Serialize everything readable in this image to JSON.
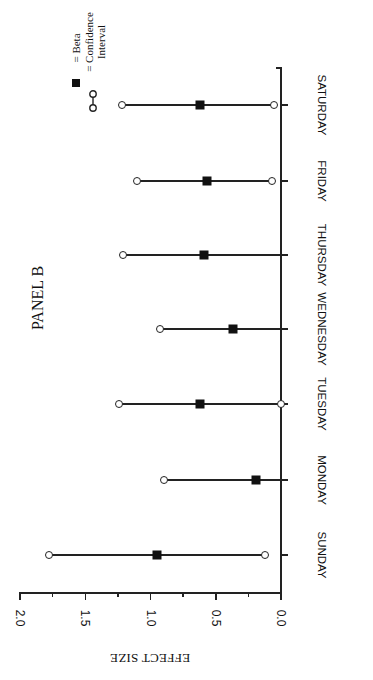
{
  "panel_label": "PANEL B",
  "legend": {
    "beta_label": "= Beta",
    "ci_label_line1": "= Confidence",
    "ci_label_line2": "Interval"
  },
  "axis": {
    "xlabel": "EFFECT SIZE",
    "ticks": [
      "2.0",
      "1.5",
      "1.0",
      "0.5",
      "0.0"
    ]
  },
  "chart_data": {
    "type": "scatter",
    "title": "PANEL B",
    "orientation": "rotated 90 degrees (categories along vertical axis, effect size along horizontal axis increasing to the left)",
    "xlabel": "EFFECT SIZE",
    "ylabel": "",
    "xlim": [
      0.0,
      2.0
    ],
    "xticks": [
      0.0,
      0.5,
      1.0,
      1.5,
      2.0
    ],
    "grid": false,
    "legend": [
      "Beta (filled square)",
      "Confidence Interval (open circles joined by line)"
    ],
    "legend_position": "top-left",
    "categories": [
      "SUNDAY",
      "MONDAY",
      "TUESDAY",
      "WEDNESDAY",
      "THURSDAY",
      "FRIDAY",
      "SATURDAY"
    ],
    "series": [
      {
        "name": "Beta",
        "values": [
          0.95,
          0.19,
          0.62,
          0.37,
          0.59,
          0.57,
          0.62
        ]
      },
      {
        "name": "CI lower",
        "values": [
          0.12,
          0.0,
          0.0,
          0.0,
          0.0,
          0.07,
          0.05
        ]
      },
      {
        "name": "CI upper",
        "values": [
          1.78,
          0.9,
          1.24,
          0.93,
          1.21,
          1.1,
          1.22
        ]
      }
    ],
    "lower_ci_marker_visible": [
      true,
      false,
      true,
      false,
      false,
      true,
      true
    ]
  },
  "rows": [
    {
      "day": "SUNDAY",
      "beta": 0.95,
      "lo": 0.12,
      "hi": 1.78,
      "lo_marker": true
    },
    {
      "day": "MONDAY",
      "beta": 0.19,
      "lo": 0.0,
      "hi": 0.9,
      "lo_marker": false
    },
    {
      "day": "TUESDAY",
      "beta": 0.62,
      "lo": 0.0,
      "hi": 1.24,
      "lo_marker": true
    },
    {
      "day": "WEDNESDAY",
      "beta": 0.37,
      "lo": 0.0,
      "hi": 0.93,
      "lo_marker": false
    },
    {
      "day": "THURSDAY",
      "beta": 0.59,
      "lo": 0.0,
      "hi": 1.21,
      "lo_marker": false
    },
    {
      "day": "FRIDAY",
      "beta": 0.57,
      "lo": 0.07,
      "hi": 1.1,
      "lo_marker": true
    },
    {
      "day": "SATURDAY",
      "beta": 0.62,
      "lo": 0.05,
      "hi": 1.22,
      "lo_marker": true
    }
  ]
}
